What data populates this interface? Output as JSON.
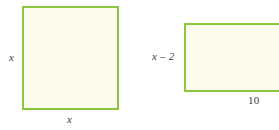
{
  "diagram": {
    "type": "geometry-figures",
    "background_color": "#ffffff",
    "edge_color": "#8cc63e",
    "fill_color": "#fbfbee",
    "label_color": "#3d3d3d",
    "figures": [
      {
        "name": "square",
        "shape": "square",
        "labels": {
          "left": "x",
          "bottom": "x"
        }
      },
      {
        "name": "rectangle",
        "shape": "rectangle",
        "labels": {
          "left": "x – 2",
          "bottom": "10"
        }
      }
    ]
  }
}
